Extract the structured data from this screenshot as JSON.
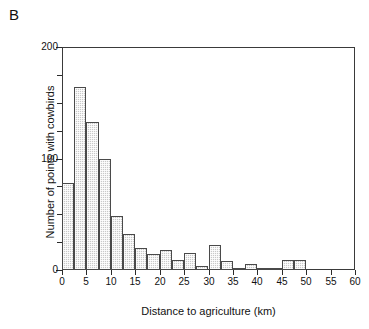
{
  "panel": {
    "letter": "B"
  },
  "chart_data": {
    "type": "bar",
    "title": "",
    "subtitle": "",
    "xlabel": "Distance to agriculture (km)",
    "ylabel": "Number of points with cowbirds",
    "xlim": [
      0,
      60
    ],
    "ylim": [
      0,
      200
    ],
    "xticks": [
      0,
      5,
      10,
      15,
      20,
      25,
      30,
      35,
      40,
      45,
      50,
      55,
      60
    ],
    "xtick_labels": [
      "0",
      "5",
      "10",
      "15",
      "20",
      "25",
      "30",
      "35",
      "40",
      "45",
      "50",
      "55",
      "60"
    ],
    "yticks": [
      0,
      100,
      200
    ],
    "ytick_labels": [
      "0",
      "100",
      "200"
    ],
    "yminor_ticks": [
      25,
      50,
      75,
      125,
      150,
      175
    ],
    "grid": false,
    "legend": null,
    "bin_width": 2.5,
    "bin_edges": [
      0,
      2.5,
      5,
      7.5,
      10,
      12.5,
      15,
      17.5,
      20,
      22.5,
      25,
      27.5,
      30,
      32.5,
      35,
      37.5,
      40,
      42.5,
      45,
      47.5,
      50
    ],
    "bin_starts": [
      0,
      2.5,
      5,
      7.5,
      10,
      12.5,
      15,
      17.5,
      20,
      22.5,
      25,
      27.5,
      30,
      32.5,
      35,
      37.5,
      40,
      42.5,
      45,
      47.5
    ],
    "values": [
      78,
      164,
      133,
      100,
      48,
      32,
      20,
      14,
      18,
      9,
      15,
      4,
      22,
      8,
      2,
      5,
      1,
      2,
      9,
      9
    ],
    "bar_color": "#c9c9c9",
    "bar_edge_color": "#4a4a4a",
    "axis_color": "#3a3a3a"
  }
}
